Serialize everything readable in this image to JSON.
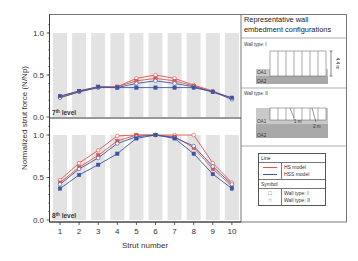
{
  "chart_data": {
    "type": "line",
    "ylabel": "Normalized strut force (N/Np)",
    "xlabel": "Strut number",
    "categories": [
      1,
      2,
      3,
      4,
      5,
      6,
      7,
      8,
      9,
      10
    ],
    "xticks": [
      "1",
      "2",
      "3",
      "4",
      "5",
      "6",
      "7",
      "8",
      "9",
      "10"
    ],
    "yticks": [
      "0.0",
      "0.5",
      "1.0"
    ],
    "ylim": [
      0,
      1.15
    ],
    "grid": false,
    "background_bars": true,
    "panels": [
      {
        "label": "7th level",
        "label_base": "7",
        "label_sup": "th",
        "label_rest": " level",
        "series": [
          {
            "name": "HS model, Wall type: II",
            "color": "#e0554e",
            "marker": "circle",
            "values": [
              0.23,
              0.3,
              0.35,
              0.36,
              0.46,
              0.5,
              0.46,
              0.38,
              0.31,
              0.22
            ]
          },
          {
            "name": "HS model, Wall type: I",
            "color": "#e0554e",
            "marker": "square",
            "values": [
              0.24,
              0.31,
              0.36,
              0.36,
              0.43,
              0.46,
              0.43,
              0.37,
              0.3,
              0.22
            ]
          },
          {
            "name": "HSS model, Wall type: II",
            "color": "#3b55a0",
            "marker": "circle",
            "values": [
              0.23,
              0.3,
              0.35,
              0.35,
              0.4,
              0.43,
              0.4,
              0.36,
              0.3,
              0.21
            ]
          },
          {
            "name": "HSS model, Wall type: I",
            "color": "#3b55a0",
            "marker": "square",
            "values": [
              0.25,
              0.31,
              0.36,
              0.35,
              0.35,
              0.35,
              0.35,
              0.35,
              0.3,
              0.23
            ]
          }
        ]
      },
      {
        "label": "8th level",
        "label_base": "8",
        "label_sup": "th",
        "label_rest": " level",
        "series": [
          {
            "name": "HS model, Wall type: II",
            "color": "#e0554e",
            "marker": "circle",
            "values": [
              0.47,
              0.67,
              0.82,
              0.99,
              1.0,
              1.0,
              1.0,
              1.0,
              0.67,
              0.44
            ]
          },
          {
            "name": "HS model, Wall type: I",
            "color": "#e0554e",
            "marker": "square",
            "values": [
              0.44,
              0.62,
              0.76,
              0.93,
              1.0,
              1.0,
              0.98,
              0.85,
              0.6,
              0.4
            ]
          },
          {
            "name": "HSS model, Wall type: II",
            "color": "#3b55a0",
            "marker": "circle",
            "values": [
              0.42,
              0.6,
              0.73,
              0.9,
              0.98,
              1.0,
              0.97,
              0.87,
              0.63,
              0.42
            ]
          },
          {
            "name": "HSS model, Wall type: I",
            "color": "#3b55a0",
            "marker": "square",
            "values": [
              0.37,
              0.53,
              0.65,
              0.78,
              0.96,
              1.0,
              0.96,
              0.78,
              0.54,
              0.37
            ]
          }
        ]
      }
    ],
    "legend": {
      "line_header": "Line",
      "lines": [
        {
          "label": "HS model",
          "color": "#e0554e"
        },
        {
          "label": "HSS model",
          "color": "#3b55a0"
        }
      ],
      "symbol_header": "Symbol",
      "symbols": [
        {
          "glyph": "□",
          "label": "Wall type: I"
        },
        {
          "glyph": "○",
          "label": "Wall type: II"
        }
      ]
    }
  },
  "side_panel": {
    "title": "Representative wall embedment configurations",
    "wall_type_1": {
      "label": "Wall type: I",
      "oa1": "OA1",
      "oa2": "OA2",
      "dimension": "4.4 m"
    },
    "wall_type_2": {
      "label": "Wall type: II",
      "oa1": "OA1",
      "oa2": "OA2",
      "dim_short": "1 m",
      "dim_long": "2 m"
    }
  },
  "colors": {
    "hs": "#e0554e",
    "hss": "#3b55a0",
    "bar": "#e3e3e3",
    "soil_light": "#c8c8c8",
    "soil_dark": "#a9a9a9"
  }
}
